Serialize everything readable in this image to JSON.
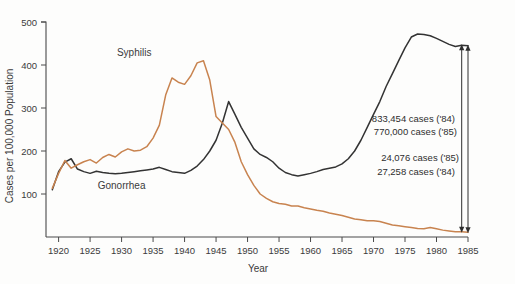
{
  "chart_data": {
    "type": "line",
    "title": "",
    "xlabel": "Year",
    "ylabel": "Cases per 100,000 Population",
    "xlim": [
      1918,
      1985
    ],
    "ylim": [
      0,
      500
    ],
    "xticks": [
      1920,
      1925,
      1930,
      1935,
      1940,
      1945,
      1950,
      1955,
      1960,
      1965,
      1970,
      1975,
      1980,
      1985
    ],
    "xtick_labels": [
      "1920",
      "1925",
      "1930",
      "1935",
      "1940",
      "1945",
      "1950",
      "1955",
      "1960",
      "1965",
      "1970",
      "1975",
      "1980",
      "1985"
    ],
    "yticks": [
      100,
      200,
      300,
      400,
      500
    ],
    "ytick_labels": [
      "100",
      "200",
      "300",
      "400",
      "500"
    ],
    "grid": false,
    "legend_position": "inline-labels",
    "series": [
      {
        "name": "Gonorrhea",
        "color": "#333333",
        "label_x": 1930,
        "label_y": 112,
        "x": [
          1919,
          1920,
          1921,
          1922,
          1923,
          1924,
          1925,
          1926,
          1927,
          1928,
          1929,
          1930,
          1931,
          1932,
          1933,
          1934,
          1935,
          1936,
          1937,
          1938,
          1939,
          1940,
          1941,
          1942,
          1943,
          1944,
          1945,
          1946,
          1947,
          1948,
          1949,
          1950,
          1951,
          1952,
          1953,
          1954,
          1955,
          1956,
          1957,
          1958,
          1959,
          1960,
          1961,
          1962,
          1963,
          1964,
          1965,
          1966,
          1967,
          1968,
          1969,
          1970,
          1971,
          1972,
          1973,
          1974,
          1975,
          1976,
          1977,
          1978,
          1979,
          1980,
          1981,
          1982,
          1983,
          1984,
          1985
        ],
        "y": [
          110,
          152,
          174,
          182,
          158,
          152,
          148,
          153,
          150,
          148,
          147,
          148,
          150,
          152,
          154,
          156,
          158,
          162,
          157,
          152,
          150,
          148,
          155,
          165,
          180,
          200,
          225,
          265,
          315,
          285,
          255,
          230,
          205,
          192,
          185,
          175,
          160,
          150,
          145,
          142,
          145,
          148,
          152,
          157,
          160,
          163,
          170,
          182,
          200,
          225,
          255,
          285,
          315,
          350,
          380,
          410,
          440,
          465,
          472,
          471,
          468,
          462,
          455,
          448,
          443,
          446,
          445
        ]
      },
      {
        "name": "Syphilis",
        "color": "#c8834f",
        "label_x": 1932,
        "label_y": 420,
        "x": [
          1919,
          1920,
          1921,
          1922,
          1923,
          1924,
          1925,
          1926,
          1927,
          1928,
          1929,
          1930,
          1931,
          1932,
          1933,
          1934,
          1935,
          1936,
          1937,
          1938,
          1939,
          1940,
          1941,
          1942,
          1943,
          1944,
          1945,
          1946,
          1947,
          1948,
          1949,
          1950,
          1951,
          1952,
          1953,
          1954,
          1955,
          1956,
          1957,
          1958,
          1959,
          1960,
          1961,
          1962,
          1963,
          1964,
          1965,
          1966,
          1967,
          1968,
          1969,
          1970,
          1971,
          1972,
          1973,
          1974,
          1975,
          1976,
          1977,
          1978,
          1979,
          1980,
          1981,
          1982,
          1983,
          1984,
          1985
        ],
        "y": [
          113,
          148,
          178,
          160,
          168,
          175,
          180,
          172,
          185,
          192,
          186,
          198,
          205,
          200,
          202,
          210,
          230,
          260,
          330,
          370,
          360,
          355,
          375,
          405,
          410,
          365,
          280,
          265,
          250,
          220,
          175,
          145,
          120,
          100,
          90,
          82,
          78,
          76,
          72,
          72,
          68,
          65,
          62,
          60,
          56,
          53,
          50,
          46,
          42,
          40,
          38,
          38,
          36,
          32,
          28,
          26,
          24,
          22,
          20,
          19,
          22,
          19,
          16,
          14,
          12,
          12,
          11
        ]
      }
    ],
    "annotations": [
      {
        "id": "gonorrhea-annotation-1",
        "text": "833,454 cases ('84)"
      },
      {
        "id": "gonorrhea-annotation-2",
        "text": "770,000 cases ('85)"
      },
      {
        "id": "syphilis-annotation-1",
        "text": "24,076 cases ('85)"
      },
      {
        "id": "syphilis-annotation-2",
        "text": "27,258 cases ('84)"
      }
    ]
  }
}
